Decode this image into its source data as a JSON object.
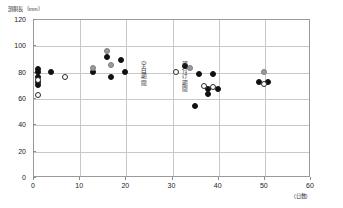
{
  "chart_data": {
    "type": "scatter",
    "title": "",
    "ylabel": "頭胴長（mm）",
    "xlabel": "",
    "x_unit_label": "(日数)",
    "xlim": [
      0,
      60
    ],
    "ylim": [
      0,
      120
    ],
    "xticks": [
      0,
      10,
      20,
      30,
      40,
      50,
      60
    ],
    "yticks": [
      0,
      20,
      40,
      60,
      80,
      100,
      120
    ],
    "grid": true,
    "legend": "none",
    "series": [
      {
        "name": "filled-black",
        "marker": "filled circle",
        "color": "#111111",
        "points": [
          {
            "x": 1,
            "y": 82
          },
          {
            "x": 1,
            "y": 80
          },
          {
            "x": 1,
            "y": 76
          },
          {
            "x": 1,
            "y": 72
          },
          {
            "x": 1,
            "y": 70
          },
          {
            "x": 4,
            "y": 80
          },
          {
            "x": 13,
            "y": 80
          },
          {
            "x": 16,
            "y": 91
          },
          {
            "x": 17,
            "y": 76
          },
          {
            "x": 19,
            "y": 89
          },
          {
            "x": 20,
            "y": 80
          },
          {
            "x": 33,
            "y": 84
          },
          {
            "x": 36,
            "y": 78
          },
          {
            "x": 39,
            "y": 78
          },
          {
            "x": 38,
            "y": 67
          },
          {
            "x": 40,
            "y": 67
          },
          {
            "x": 38,
            "y": 63
          },
          {
            "x": 35,
            "y": 54
          },
          {
            "x": 49,
            "y": 72
          },
          {
            "x": 51,
            "y": 72
          }
        ]
      },
      {
        "name": "gray",
        "marker": "gray circle",
        "color": "#9b9b9b",
        "points": [
          {
            "x": 13,
            "y": 83
          },
          {
            "x": 16,
            "y": 96
          },
          {
            "x": 17,
            "y": 85
          },
          {
            "x": 34,
            "y": 83
          },
          {
            "x": 50,
            "y": 80
          }
        ]
      },
      {
        "name": "open-white",
        "marker": "open circle",
        "color": "#ffffff",
        "points": [
          {
            "x": 1,
            "y": 74
          },
          {
            "x": 1,
            "y": 62
          },
          {
            "x": 7,
            "y": 76
          },
          {
            "x": 31,
            "y": 80
          },
          {
            "x": 37,
            "y": 69
          },
          {
            "x": 39,
            "y": 68
          },
          {
            "x": 50,
            "y": 71
          }
        ]
      }
    ],
    "annotations": [
      {
        "name": "blank-period",
        "text": "空白期間",
        "x": 24,
        "y": 76,
        "orientation": "vertical"
      },
      {
        "name": "parent-attached-period",
        "text": "親付け期間",
        "x": 33,
        "y": 76,
        "orientation": "vertical"
      }
    ]
  }
}
